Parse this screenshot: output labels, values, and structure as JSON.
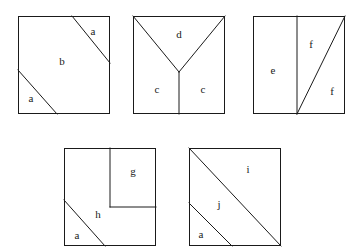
{
  "page": {
    "background_color": "#ffffff",
    "line_color": "#1a1a1a",
    "label_color": "#1a1a1a",
    "width": 362,
    "height": 252
  },
  "figures": [
    {
      "id": "figure-1",
      "name": "square-parallel-diagonal-cuts",
      "box": {
        "x": 18,
        "y": 16,
        "w": 92,
        "h": 98
      },
      "cuts": [
        {
          "name": "upper-right-diagonal-cut",
          "x1": 72,
          "y1": 16,
          "x2": 110,
          "y2": 63
        },
        {
          "name": "lower-left-diagonal-cut",
          "x1": 18,
          "y1": 70,
          "x2": 57,
          "y2": 114
        }
      ],
      "labels": [
        {
          "name": "label-a-top",
          "text": "a",
          "x": 93,
          "y": 32
        },
        {
          "name": "label-b-middle",
          "text": "b",
          "x": 62,
          "y": 62
        },
        {
          "name": "label-a-bottom",
          "text": "a",
          "x": 31,
          "y": 99
        }
      ]
    },
    {
      "id": "figure-2",
      "name": "square-y-partition",
      "box": {
        "x": 133,
        "y": 16,
        "w": 92,
        "h": 98
      },
      "cuts": [
        {
          "name": "left-arm-cut",
          "x1": 133,
          "y1": 16,
          "x2": 179,
          "y2": 72
        },
        {
          "name": "right-arm-cut",
          "x1": 225,
          "y1": 16,
          "x2": 179,
          "y2": 72
        },
        {
          "name": "stem-cut",
          "x1": 179,
          "y1": 72,
          "x2": 179,
          "y2": 114
        }
      ],
      "labels": [
        {
          "name": "label-d-top",
          "text": "d",
          "x": 179,
          "y": 35
        },
        {
          "name": "label-c-left",
          "text": "c",
          "x": 157,
          "y": 90
        },
        {
          "name": "label-c-right",
          "text": "c",
          "x": 203,
          "y": 90
        }
      ]
    },
    {
      "id": "figure-3",
      "name": "square-vertical-split-with-diagonal",
      "box": {
        "x": 253,
        "y": 16,
        "w": 92,
        "h": 98
      },
      "cuts": [
        {
          "name": "vertical-divider-cut",
          "x1": 297,
          "y1": 16,
          "x2": 297,
          "y2": 114
        },
        {
          "name": "rising-diagonal-cut",
          "x1": 297,
          "y1": 114,
          "x2": 345,
          "y2": 16
        }
      ],
      "labels": [
        {
          "name": "label-e-left",
          "text": "e",
          "x": 273,
          "y": 71
        },
        {
          "name": "label-f-upper",
          "text": "f",
          "x": 311,
          "y": 45
        },
        {
          "name": "label-f-lower",
          "text": "f",
          "x": 332,
          "y": 92
        }
      ]
    },
    {
      "id": "figure-4",
      "name": "square-inset-square-and-corner-cut",
      "box": {
        "x": 64,
        "y": 148,
        "w": 92,
        "h": 98
      },
      "cuts": [
        {
          "name": "inset-square-left-cut",
          "x1": 110,
          "y1": 148,
          "x2": 110,
          "y2": 207
        },
        {
          "name": "inset-square-bottom-cut",
          "x1": 110,
          "y1": 207,
          "x2": 156,
          "y2": 207
        },
        {
          "name": "lower-left-diagonal-cut",
          "x1": 64,
          "y1": 200,
          "x2": 105,
          "y2": 246
        }
      ],
      "labels": [
        {
          "name": "label-g-inset",
          "text": "g",
          "x": 133,
          "y": 172
        },
        {
          "name": "label-h-region",
          "text": "h",
          "x": 98,
          "y": 215
        },
        {
          "name": "label-a-corner",
          "text": "a",
          "x": 77,
          "y": 236
        }
      ]
    },
    {
      "id": "figure-5",
      "name": "square-main-diagonal-with-parallel-cut",
      "box": {
        "x": 189,
        "y": 148,
        "w": 92,
        "h": 98
      },
      "cuts": [
        {
          "name": "main-diagonal-cut",
          "x1": 189,
          "y1": 148,
          "x2": 281,
          "y2": 246
        },
        {
          "name": "parallel-small-cut",
          "x1": 189,
          "y1": 203,
          "x2": 232,
          "y2": 246
        }
      ],
      "labels": [
        {
          "name": "label-i-upper",
          "text": "i",
          "x": 248,
          "y": 170
        },
        {
          "name": "label-j-middle",
          "text": "j",
          "x": 219,
          "y": 205
        },
        {
          "name": "label-a-corner",
          "text": "a",
          "x": 201,
          "y": 235
        }
      ]
    }
  ]
}
